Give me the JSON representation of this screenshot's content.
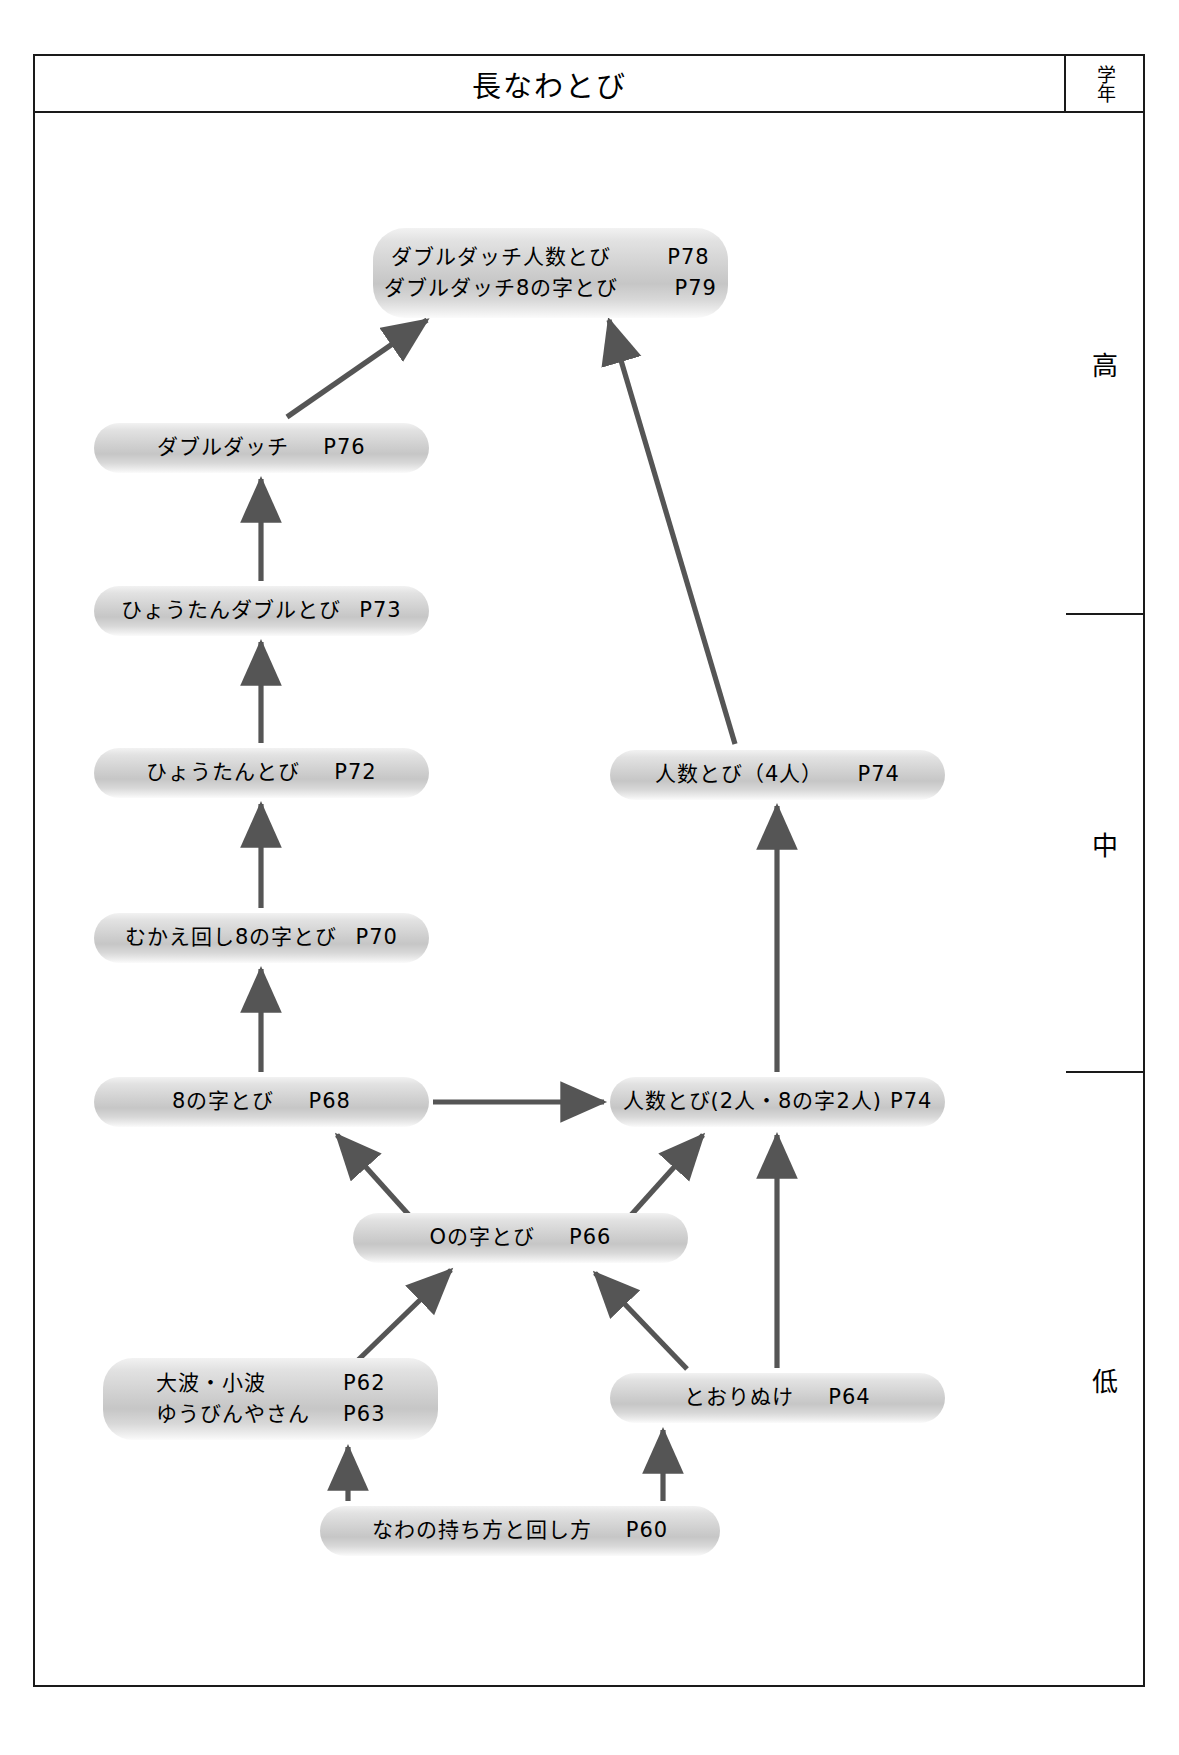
{
  "title": "長なわとび",
  "grade_column": {
    "header": "学年",
    "bands": [
      {
        "key": "high",
        "label": "高"
      },
      {
        "key": "mid",
        "label": "中"
      },
      {
        "key": "low",
        "label": "低"
      }
    ]
  },
  "nodes": [
    {
      "id": "dd-ninzu",
      "lines": [
        {
          "text": "ダブルダッチ人数とび",
          "page": "P78"
        },
        {
          "text": "ダブルダッチ8の字とび",
          "page": "P79"
        }
      ]
    },
    {
      "id": "double",
      "lines": [
        {
          "text": "ダブルダッチ",
          "page": "P76"
        }
      ]
    },
    {
      "id": "hyoutan-double",
      "lines": [
        {
          "text": "ひょうたんダブルとび",
          "page": "P73"
        }
      ]
    },
    {
      "id": "hyoutan",
      "lines": [
        {
          "text": "ひょうたんとび",
          "page": "P72"
        }
      ]
    },
    {
      "id": "ninzu-4",
      "lines": [
        {
          "text": "人数とび（4人）",
          "page": "P74"
        }
      ]
    },
    {
      "id": "mukae",
      "lines": [
        {
          "text": "むかえ回し8の字とび",
          "page": "P70"
        }
      ]
    },
    {
      "id": "hachi",
      "lines": [
        {
          "text": "8の字とび",
          "page": "P68"
        }
      ]
    },
    {
      "id": "ninzu-2",
      "lines": [
        {
          "text": "人数とび(2人・8の字2人)",
          "page": "P74"
        }
      ]
    },
    {
      "id": "maru",
      "lines": [
        {
          "text": "Oの字とび",
          "page": "P66"
        }
      ]
    },
    {
      "id": "oonami",
      "lines": [
        {
          "text": "大波・小波",
          "page": "P62"
        },
        {
          "text": "ゆうびんやさん",
          "page": "P63"
        }
      ]
    },
    {
      "id": "toorinuke",
      "lines": [
        {
          "text": "とおりぬけ",
          "page": "P64"
        }
      ]
    },
    {
      "id": "mochikata",
      "lines": [
        {
          "text": "なわの持ち方と回し方",
          "page": "P60"
        }
      ]
    }
  ],
  "edges": [
    {
      "from": "double",
      "to": "dd-ninzu"
    },
    {
      "from": "ninzu-4",
      "to": "dd-ninzu"
    },
    {
      "from": "hyoutan-double",
      "to": "double"
    },
    {
      "from": "hyoutan",
      "to": "hyoutan-double"
    },
    {
      "from": "mukae",
      "to": "hyoutan"
    },
    {
      "from": "hachi",
      "to": "mukae"
    },
    {
      "from": "hachi",
      "to": "ninzu-2"
    },
    {
      "from": "ninzu-2",
      "to": "ninzu-4"
    },
    {
      "from": "maru",
      "to": "hachi"
    },
    {
      "from": "maru",
      "to": "ninzu-2"
    },
    {
      "from": "oonami",
      "to": "maru"
    },
    {
      "from": "toorinuke",
      "to": "maru"
    },
    {
      "from": "toorinuke",
      "to": "ninzu-2"
    },
    {
      "from": "mochikata",
      "to": "oonami"
    },
    {
      "from": "mochikata",
      "to": "toorinuke"
    }
  ],
  "colors": {
    "frame": "#1a1a1a",
    "arrow": "#555555",
    "node_fill_light": "#f2f2f2",
    "node_fill_dark": "#c6c6c6",
    "text": "#000000"
  }
}
